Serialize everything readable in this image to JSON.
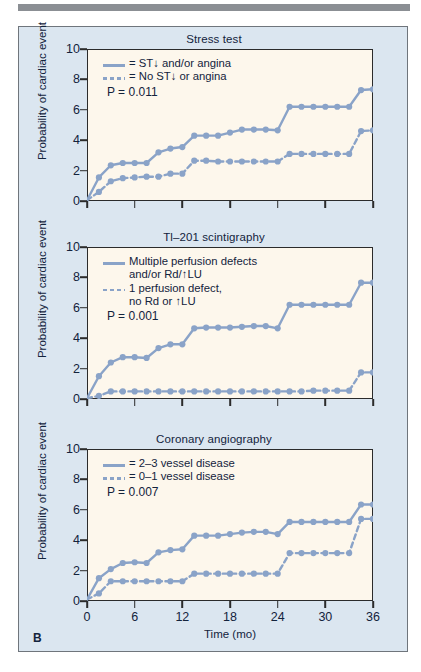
{
  "figure": {
    "panel_letter": "B",
    "accent_color": "#8aa3c8",
    "plot_bg": "#fdf7ec",
    "figure_bg": "#dbe6f0",
    "axis_color": "#2b2b2b"
  },
  "chart_data": [
    {
      "type": "line",
      "title": "Stress test",
      "xlabel": "",
      "ylabel": "Probability of cardiac event",
      "xlim": [
        0,
        36
      ],
      "ylim": [
        0,
        10
      ],
      "yticks": [
        0,
        2,
        4,
        6,
        8,
        10
      ],
      "xticks": [
        0,
        6,
        12,
        18,
        24,
        30,
        36
      ],
      "grid": false,
      "legend_position": "inside-top-left",
      "annotation": "P = 0.011",
      "series": [
        {
          "name": "= ST↓ and/or angina",
          "style": "solid",
          "x": [
            0,
            1.5,
            3,
            4.5,
            6,
            7.5,
            9,
            10.5,
            12,
            13.5,
            15,
            16.5,
            18,
            19.5,
            21,
            22.5,
            24,
            25.5,
            27,
            28.5,
            30,
            31.5,
            33,
            34.5,
            36
          ],
          "y": [
            0.05,
            1.55,
            2.35,
            2.5,
            2.5,
            2.5,
            3.2,
            3.45,
            3.55,
            4.3,
            4.3,
            4.3,
            4.5,
            4.7,
            4.7,
            4.7,
            4.65,
            6.2,
            6.2,
            6.2,
            6.2,
            6.2,
            6.2,
            7.3,
            7.35
          ]
        },
        {
          "name": "= No ST↓ or angina",
          "style": "dashed",
          "x": [
            0,
            1.5,
            3,
            4.5,
            6,
            7.5,
            9,
            10.5,
            12,
            13.5,
            15,
            16.5,
            18,
            19.5,
            21,
            22.5,
            24,
            25.5,
            27,
            28.5,
            30,
            31.5,
            33,
            34.5,
            36
          ],
          "y": [
            0.05,
            0.6,
            1.3,
            1.5,
            1.55,
            1.6,
            1.6,
            1.8,
            1.8,
            2.65,
            2.65,
            2.6,
            2.6,
            2.6,
            2.6,
            2.6,
            2.6,
            3.1,
            3.1,
            3.1,
            3.1,
            3.1,
            3.1,
            4.6,
            4.65
          ]
        }
      ]
    },
    {
      "type": "line",
      "title": "Tl–201 scintigraphy",
      "xlabel": "",
      "ylabel": "Probability of cardiac event",
      "xlim": [
        0,
        36
      ],
      "ylim": [
        0,
        10
      ],
      "yticks": [
        0,
        2,
        4,
        6,
        8,
        10
      ],
      "xticks": [
        0,
        6,
        12,
        18,
        24,
        30,
        36
      ],
      "grid": false,
      "legend_position": "inside-top-left",
      "annotation": "P = 0.001",
      "series": [
        {
          "name": "Multiple perfusion defects and/or Rd/↑LU",
          "style": "solid",
          "x": [
            0,
            1.5,
            3,
            4.5,
            6,
            7.5,
            9,
            10.5,
            12,
            13.5,
            15,
            16.5,
            18,
            19.5,
            21,
            22.5,
            24,
            25.5,
            27,
            28.5,
            30,
            31.5,
            33,
            34.5,
            36
          ],
          "y": [
            0.05,
            1.5,
            2.4,
            2.75,
            2.75,
            2.7,
            3.35,
            3.6,
            3.6,
            4.65,
            4.7,
            4.7,
            4.7,
            4.75,
            4.8,
            4.8,
            4.65,
            6.2,
            6.2,
            6.2,
            6.2,
            6.2,
            6.2,
            7.65,
            7.65
          ]
        },
        {
          "name": "1 perfusion defect, no Rd or ↑LU",
          "style": "dashed",
          "x": [
            0,
            1.5,
            3,
            4.5,
            6,
            7.5,
            9,
            10.5,
            12,
            13.5,
            15,
            16.5,
            18,
            19.5,
            21,
            22.5,
            24,
            25.5,
            27,
            28.5,
            30,
            31.5,
            33,
            34.5,
            36
          ],
          "y": [
            0.05,
            0.2,
            0.5,
            0.5,
            0.5,
            0.5,
            0.5,
            0.5,
            0.5,
            0.5,
            0.5,
            0.5,
            0.5,
            0.5,
            0.5,
            0.5,
            0.5,
            0.5,
            0.5,
            0.55,
            0.55,
            0.55,
            0.55,
            1.75,
            1.75
          ]
        }
      ]
    },
    {
      "type": "line",
      "title": "Coronary angiography",
      "xlabel": "Time (mo)",
      "ylabel": "Probability of cardiac event",
      "xlim": [
        0,
        36
      ],
      "ylim": [
        0,
        10
      ],
      "yticks": [
        0,
        2,
        4,
        6,
        8,
        10
      ],
      "xticks": [
        0,
        6,
        12,
        18,
        24,
        30,
        36
      ],
      "grid": false,
      "legend_position": "inside-top-left",
      "annotation": "P = 0.007",
      "series": [
        {
          "name": "= 2–3 vessel disease",
          "style": "solid",
          "x": [
            0,
            1.5,
            3,
            4.5,
            6,
            7.5,
            9,
            10.5,
            12,
            13.5,
            15,
            16.5,
            18,
            19.5,
            21,
            22.5,
            24,
            25.5,
            27,
            28.5,
            30,
            31.5,
            33,
            34.5,
            36
          ],
          "y": [
            0.1,
            1.5,
            2.1,
            2.5,
            2.55,
            2.5,
            3.2,
            3.35,
            3.4,
            4.3,
            4.3,
            4.3,
            4.4,
            4.5,
            4.55,
            4.55,
            4.4,
            5.2,
            5.2,
            5.2,
            5.2,
            5.2,
            5.2,
            6.35,
            6.35
          ]
        },
        {
          "name": "= 0–1 vessel disease",
          "style": "dashed",
          "x": [
            0,
            1.5,
            3,
            4.5,
            6,
            7.5,
            9,
            10.5,
            12,
            13.5,
            15,
            16.5,
            18,
            19.5,
            21,
            22.5,
            24,
            25.5,
            27,
            28.5,
            30,
            31.5,
            33,
            34.5,
            36
          ],
          "y": [
            0.1,
            0.5,
            1.3,
            1.3,
            1.3,
            1.3,
            1.3,
            1.3,
            1.3,
            1.8,
            1.8,
            1.8,
            1.8,
            1.8,
            1.8,
            1.8,
            1.8,
            3.15,
            3.15,
            3.15,
            3.15,
            3.15,
            3.15,
            5.4,
            5.4
          ]
        }
      ]
    }
  ],
  "panels": [
    {
      "title": "Stress test",
      "ylabel": "Probability of cardiac event",
      "xlabel": "",
      "legend": {
        "line1": "= ST↓ and/or angina",
        "line1_sub": "",
        "line2": "= No ST↓ or angina",
        "line2_sub": "",
        "pvalue": "P = 0.011"
      }
    },
    {
      "title": "Tl–201 scintigraphy",
      "ylabel": "Probability of cardiac event",
      "xlabel": "",
      "legend": {
        "line1": "Multiple perfusion defects",
        "line1_sub": "and/or Rd/↑LU",
        "line2": "1 perfusion defect,",
        "line2_sub": "no Rd or ↑LU",
        "pvalue": "P = 0.001"
      }
    },
    {
      "title": "Coronary angiography",
      "ylabel": "Probability of cardiac event",
      "xlabel": "Time (mo)",
      "legend": {
        "line1": "= 2–3 vessel disease",
        "line1_sub": "",
        "line2": "= 0–1 vessel disease",
        "line2_sub": "",
        "pvalue": "P = 0.007"
      }
    }
  ],
  "yticks": {
    "t0": "0",
    "t1": "2",
    "t2": "4",
    "t3": "6",
    "t4": "8",
    "t5": "10"
  },
  "xticks": {
    "t0": "0",
    "t1": "6",
    "t2": "12",
    "t3": "18",
    "t4": "24",
    "t5": "30",
    "t6": "36"
  }
}
